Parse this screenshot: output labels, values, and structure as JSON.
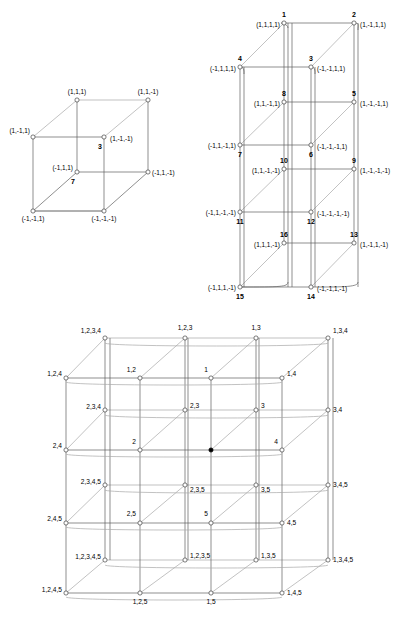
{
  "figures": {
    "cube3d": {
      "name": "3-dimensional cube with signed coordinate vertex labels",
      "vertices": [
        {
          "id": "c1",
          "x": 77,
          "y": 100,
          "label": "(1,1,1)",
          "lx": 77,
          "ly": 93,
          "anchor": "middle",
          "bold": null
        },
        {
          "id": "c2",
          "x": 148,
          "y": 100,
          "label": "(1,1,-1)",
          "lx": 148,
          "ly": 93,
          "anchor": "middle",
          "bold": null
        },
        {
          "id": "c3",
          "x": 33,
          "y": 137,
          "label": "(1,-1,1)",
          "lx": 30,
          "ly": 132,
          "anchor": "end",
          "bold": null
        },
        {
          "id": "c4",
          "x": 104,
          "y": 137,
          "label": "(1,-1,-1)",
          "lx": 109,
          "ly": 141,
          "anchor": "start",
          "bold": "3"
        },
        {
          "id": "c5",
          "x": 77,
          "y": 172,
          "label": "(-1,1,1)",
          "lx": 73,
          "ly": 170,
          "anchor": "end",
          "bold": "7"
        },
        {
          "id": "c6",
          "x": 148,
          "y": 172,
          "label": "(-1,1,-1)",
          "lx": 152,
          "ly": 174,
          "anchor": "start",
          "bold": null
        },
        {
          "id": "c7",
          "x": 33,
          "y": 211,
          "label": "(-1,-1,1)",
          "lx": 33,
          "ly": 221,
          "anchor": "middle",
          "bold": null
        },
        {
          "id": "c8",
          "x": 104,
          "y": 211,
          "label": "(-1,-1,-1)",
          "lx": 104,
          "ly": 221,
          "anchor": "middle",
          "bold": null
        }
      ],
      "bold_labels": [
        {
          "text": "3",
          "x": 102,
          "y": 148
        },
        {
          "text": "7",
          "x": 75,
          "y": 183
        }
      ]
    },
    "hyper4d": {
      "name": "4-dimensional hypercube drawn as four stacked cubes",
      "vertices": [
        {
          "n": "1",
          "coord": "(1,1,1,1)",
          "x": 88,
          "y": 23,
          "nx": 88,
          "ny": 16,
          "cx": 84,
          "cy": 27,
          "ca": "end"
        },
        {
          "n": "2",
          "coord": "(1,-1,1,1)",
          "x": 158,
          "y": 23,
          "nx": 158,
          "ny": 16,
          "cx": 163,
          "cy": 27,
          "ca": "start"
        },
        {
          "n": "3",
          "coord": "(-1,-1,1,1)",
          "x": 115,
          "y": 67,
          "nx": 115,
          "ny": 60,
          "cx": 120,
          "cy": 71,
          "ca": "start"
        },
        {
          "n": "4",
          "coord": "(-1,1,1,1)",
          "x": 44,
          "y": 67,
          "nx": 44,
          "ny": 60,
          "cx": 40,
          "cy": 71,
          "ca": "end"
        },
        {
          "n": "5",
          "coord": "(1,-1,-1,1)",
          "x": 158,
          "y": 102,
          "nx": 158,
          "ny": 95,
          "cx": 163,
          "cy": 106,
          "ca": "start"
        },
        {
          "n": "6",
          "coord": "(-1,-1,-1,1)",
          "x": 115,
          "y": 145,
          "nx": 115,
          "ny": 155,
          "cx": 120,
          "cy": 148,
          "ca": "start"
        },
        {
          "n": "7",
          "coord": "(-1,1,-1,1)",
          "x": 44,
          "y": 145,
          "nx": 44,
          "ny": 155,
          "cx": 40,
          "cy": 148,
          "ca": "end"
        },
        {
          "n": "8",
          "coord": "(1,1,-1,1)",
          "x": 88,
          "y": 102,
          "nx": 88,
          "ny": 95,
          "cx": 84,
          "cy": 106,
          "ca": "end"
        },
        {
          "n": "9",
          "coord": "(1,-1,-1,-1)",
          "x": 158,
          "y": 169,
          "nx": 158,
          "ny": 162,
          "cx": 163,
          "cy": 173,
          "ca": "start"
        },
        {
          "n": "10",
          "coord": "(1,1,-1,-1)",
          "x": 88,
          "y": 169,
          "nx": 88,
          "ny": 162,
          "cx": 84,
          "cy": 173,
          "ca": "end"
        },
        {
          "n": "11",
          "coord": "(-1,1,-1,-1)",
          "x": 44,
          "y": 212,
          "nx": 44,
          "ny": 222,
          "cx": 40,
          "cy": 215,
          "ca": "end"
        },
        {
          "n": "12",
          "coord": "(-1,-1,-1,-1)",
          "x": 115,
          "y": 212,
          "nx": 115,
          "ny": 222,
          "cx": 120,
          "cy": 215,
          "ca": "start"
        },
        {
          "n": "13",
          "coord": "(1,-1,1,-1)",
          "x": 158,
          "y": 243,
          "nx": 158,
          "ny": 236,
          "cx": 163,
          "cy": 247,
          "ca": "start"
        },
        {
          "n": "14",
          "coord": "(-1,-1,1,-1)",
          "x": 115,
          "y": 287,
          "nx": 115,
          "ny": 297,
          "cx": 120,
          "cy": 290,
          "ca": "start"
        },
        {
          "n": "15",
          "coord": "(-1,1,1,-1)",
          "x": 44,
          "y": 287,
          "nx": 44,
          "ny": 297,
          "cx": 40,
          "cy": 290,
          "ca": "end"
        },
        {
          "n": "16",
          "coord": "(1,1,1,-1)",
          "x": 88,
          "y": 243,
          "nx": 88,
          "ny": 236,
          "cx": 84,
          "cy": 247,
          "ca": "end"
        }
      ]
    },
    "lattice": {
      "name": "Five-dimensional lattice / cube complex with subset labels",
      "labels_top": [
        "1,2,3,4",
        "1,2,3",
        "1,3",
        "1,3,4"
      ],
      "labels_row2": [
        "1,2,4",
        "1,2",
        "1",
        "1,4"
      ],
      "labels_row3": [
        "2,3,4",
        "2,3",
        "3",
        "3,4"
      ],
      "labels_row4": [
        "2,4",
        "2",
        "",
        "4"
      ],
      "labels_row5": [
        "2,3,4,5",
        "2,3,5",
        "3,5",
        "3,4,5"
      ],
      "labels_row6": [
        "2,4,5",
        "2,5",
        "5",
        "4,5"
      ],
      "labels_row7": [
        "1,2,3,4,5",
        "1,2,3,5",
        "1,3,5",
        "1,3,4,5"
      ],
      "labels_bottom": [
        "1,2,4,5",
        "1,2,5",
        "1,5",
        "1,4,5"
      ],
      "filled_node_label": "",
      "nodes": [
        {
          "l": "1,2,3,4",
          "x": 105,
          "y": 20,
          "tx": 101,
          "ty": 15,
          "a": "end"
        },
        {
          "l": "1,2,3",
          "x": 185,
          "y": 20,
          "tx": 185,
          "ty": 12,
          "a": "middle"
        },
        {
          "l": "1,3",
          "x": 256,
          "y": 20,
          "tx": 256,
          "ty": 12,
          "a": "middle"
        },
        {
          "l": "1,3,4",
          "x": 328,
          "y": 20,
          "tx": 333,
          "ty": 15,
          "a": "start"
        },
        {
          "l": "1,2,4",
          "x": 66,
          "y": 60,
          "tx": 62,
          "ty": 58,
          "a": "end"
        },
        {
          "l": "1,2",
          "x": 140,
          "y": 60,
          "tx": 136,
          "ty": 54,
          "a": "end"
        },
        {
          "l": "1",
          "x": 211,
          "y": 60,
          "tx": 208,
          "ty": 54,
          "a": "end"
        },
        {
          "l": "1,4",
          "x": 282,
          "y": 60,
          "tx": 287,
          "ty": 58,
          "a": "start"
        },
        {
          "l": "2,3,4",
          "x": 105,
          "y": 92,
          "tx": 101,
          "ty": 91,
          "a": "end"
        },
        {
          "l": "2,3",
          "x": 185,
          "y": 92,
          "tx": 190,
          "ty": 90,
          "a": "start"
        },
        {
          "l": "3",
          "x": 256,
          "y": 92,
          "tx": 261,
          "ty": 90,
          "a": "start"
        },
        {
          "l": "3,4",
          "x": 328,
          "y": 92,
          "tx": 333,
          "ty": 94,
          "a": "start"
        },
        {
          "l": "2,4",
          "x": 66,
          "y": 132,
          "tx": 62,
          "ty": 130,
          "a": "end"
        },
        {
          "l": "2",
          "x": 140,
          "y": 132,
          "tx": 136,
          "ty": 126,
          "a": "end"
        },
        {
          "l": "",
          "x": 211,
          "y": 132,
          "tx": 211,
          "ty": 126,
          "a": "middle"
        },
        {
          "l": "4",
          "x": 282,
          "y": 132,
          "tx": 278,
          "ty": 126,
          "a": "end"
        },
        {
          "l": "2,3,4,5",
          "x": 105,
          "y": 167,
          "tx": 101,
          "ty": 166,
          "a": "end"
        },
        {
          "l": "2,3,5",
          "x": 185,
          "y": 167,
          "tx": 190,
          "ty": 174,
          "a": "start"
        },
        {
          "l": "3,5",
          "x": 256,
          "y": 167,
          "tx": 261,
          "ty": 174,
          "a": "start"
        },
        {
          "l": "3,4,5",
          "x": 328,
          "y": 167,
          "tx": 333,
          "ty": 169,
          "a": "start"
        },
        {
          "l": "2,4,5",
          "x": 66,
          "y": 205,
          "tx": 62,
          "ty": 203,
          "a": "end"
        },
        {
          "l": "2,5",
          "x": 140,
          "y": 205,
          "tx": 136,
          "ty": 198,
          "a": "end"
        },
        {
          "l": "5",
          "x": 211,
          "y": 205,
          "tx": 208,
          "ty": 198,
          "a": "end"
        },
        {
          "l": "4,5",
          "x": 282,
          "y": 205,
          "tx": 287,
          "ty": 207,
          "a": "start"
        },
        {
          "l": "1,2,3,4,5",
          "x": 105,
          "y": 242,
          "tx": 101,
          "ty": 241,
          "a": "end"
        },
        {
          "l": "1,2,3,5",
          "x": 185,
          "y": 242,
          "tx": 190,
          "ty": 240,
          "a": "start"
        },
        {
          "l": "1,3,5",
          "x": 256,
          "y": 242,
          "tx": 261,
          "ty": 240,
          "a": "start"
        },
        {
          "l": "1,3,4,5",
          "x": 328,
          "y": 242,
          "tx": 333,
          "ty": 244,
          "a": "start"
        },
        {
          "l": "1,2,4,5",
          "x": 66,
          "y": 275,
          "tx": 62,
          "ty": 274,
          "a": "end"
        },
        {
          "l": "1,2,5",
          "x": 140,
          "y": 275,
          "tx": 140,
          "ty": 286,
          "a": "middle"
        },
        {
          "l": "1,5",
          "x": 211,
          "y": 275,
          "tx": 211,
          "ty": 286,
          "a": "middle"
        },
        {
          "l": "1,4,5",
          "x": 282,
          "y": 275,
          "tx": 287,
          "ty": 277,
          "a": "start"
        }
      ]
    }
  }
}
